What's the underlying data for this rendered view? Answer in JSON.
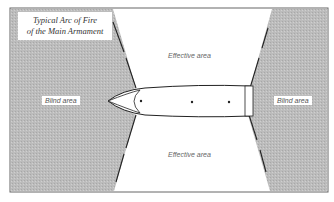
{
  "title": {
    "line1": "Typical Arc of Fire",
    "line2": "of the Main Armament"
  },
  "labels": {
    "blind_left": "Blind area",
    "blind_right": "Blind area",
    "effective_top": "Effective area",
    "effective_bottom": "Effective area"
  },
  "colors": {
    "blind_fill": "#b9b9b9",
    "effective_fill": "#ffffff",
    "frame": "#555555",
    "boundary": "#222222"
  },
  "ship": {
    "turret_count": 3
  }
}
